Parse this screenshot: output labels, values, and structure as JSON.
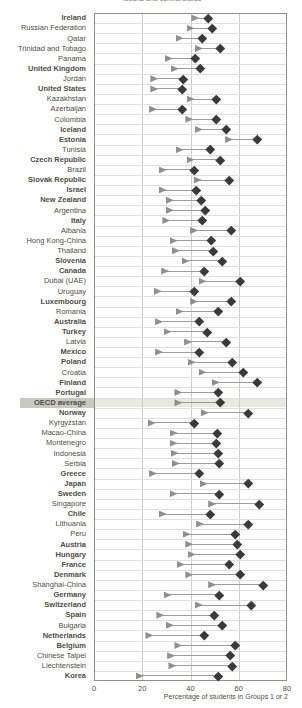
{
  "header": {
    "cropped_title_fragment": "federal and central states"
  },
  "axis": {
    "label": "Percentage of students in Groups 1 or 2",
    "ticks": [
      0,
      20,
      40,
      60,
      80
    ]
  },
  "colors": {
    "triangle": "#8f8f8f",
    "diamond": "#3a3a3a",
    "connector": "#9c9c9c",
    "highlight_label_band": "#c8c8c0",
    "highlight_plot_band": "#e9e9e1",
    "text": "#4e4e44"
  },
  "chart_data": {
    "type": "scatter",
    "subtype": "dumbbell",
    "xlabel": "Percentage of students in Groups 1 or 2",
    "xlim": [
      0,
      80
    ],
    "xticks": [
      0,
      20,
      40,
      60,
      80
    ],
    "grid": true,
    "highlight_row": "OECD average",
    "categories": [
      "Ireland",
      "Russian Federation",
      "Qatar",
      "Trinidad and Tobago",
      "Panama",
      "United Kingdom",
      "Jordan",
      "United States",
      "Kazakhstan",
      "Azerbaijan",
      "Colombia",
      "Iceland",
      "Estonia",
      "Tunisia",
      "Czech Republic",
      "Brazil",
      "Slovak Republic",
      "Israel",
      "New Zealand",
      "Argentina",
      "Italy",
      "Albania",
      "Hong Kong-China",
      "Thailand",
      "Slovenia",
      "Canada",
      "Dubai (UAE)",
      "Uruguay",
      "Luxembourg",
      "Romania",
      "Australia",
      "Turkey",
      "Latvia",
      "Mexico",
      "Poland",
      "Croatia",
      "Finland",
      "Portugal",
      "OECD average",
      "Norway",
      "Kyrgyzstan",
      "Macao-China",
      "Montenegro",
      "Indonesia",
      "Serbia",
      "Greece",
      "Japan",
      "Sweden",
      "Singapore",
      "Chile",
      "Lithuania",
      "Peru",
      "Austria",
      "Hungary",
      "France",
      "Denmark",
      "Shanghai-China",
      "Germany",
      "Switzerland",
      "Spain",
      "Bulgaria",
      "Netherlands",
      "Belgium",
      "Chinese Taipei",
      "Liechtenstein",
      "Korea"
    ],
    "bold_categories": [
      "Ireland",
      "United Kingdom",
      "United States",
      "Iceland",
      "Estonia",
      "Czech Republic",
      "Slovak Republic",
      "Israel",
      "New Zealand",
      "Italy",
      "Slovenia",
      "Canada",
      "Luxembourg",
      "Australia",
      "Turkey",
      "Mexico",
      "Poland",
      "Finland",
      "Portugal",
      "OECD average",
      "Norway",
      "Greece",
      "Japan",
      "Sweden",
      "Chile",
      "Austria",
      "Hungary",
      "France",
      "Denmark",
      "Germany",
      "Switzerland",
      "Spain",
      "Netherlands",
      "Belgium",
      "Korea"
    ],
    "series": [
      {
        "name": "triangle-marker-value",
        "marker": "triangle-right",
        "color": "#8f8f8f",
        "values": [
          42,
          40,
          35.5,
          43.5,
          31,
          33.5,
          25,
          25,
          40,
          24.5,
          39.5,
          43.5,
          56,
          35.5,
          40,
          28.5,
          43,
          28.5,
          31.5,
          31.5,
          30,
          41.5,
          33,
          34,
          38,
          29.5,
          45,
          26.5,
          41.5,
          35.5,
          27,
          30.5,
          39,
          27,
          40.5,
          45,
          50.5,
          35,
          35,
          46,
          24,
          33,
          33,
          33.5,
          34,
          24.5,
          45.5,
          33,
          49,
          28.5,
          44,
          38.5,
          39.5,
          40.5,
          36,
          39.5,
          49,
          30.5,
          43.5,
          27.5,
          31.5,
          23,
          35,
          32,
          32.5,
          19
        ]
      },
      {
        "name": "diamond-marker-value",
        "marker": "diamond",
        "color": "#3a3a3a",
        "values": [
          47.5,
          49,
          45,
          52.5,
          42,
          44,
          37,
          36.5,
          50.5,
          36.5,
          50.5,
          55,
          67.5,
          48,
          52.5,
          41.5,
          56,
          42.5,
          44.5,
          46,
          45,
          57,
          48.5,
          49.5,
          53,
          45.5,
          60.5,
          41.5,
          57,
          51.5,
          43.5,
          47,
          55,
          43.5,
          57.5,
          62,
          67.5,
          51.5,
          52.5,
          64,
          41.5,
          51,
          50.5,
          51.5,
          52,
          43.5,
          64,
          52,
          68.5,
          48,
          64,
          58.5,
          59.5,
          60.5,
          56,
          60.5,
          70,
          52,
          65,
          50,
          53,
          45.5,
          58.5,
          56.5,
          57.5,
          51.5
        ]
      }
    ]
  }
}
